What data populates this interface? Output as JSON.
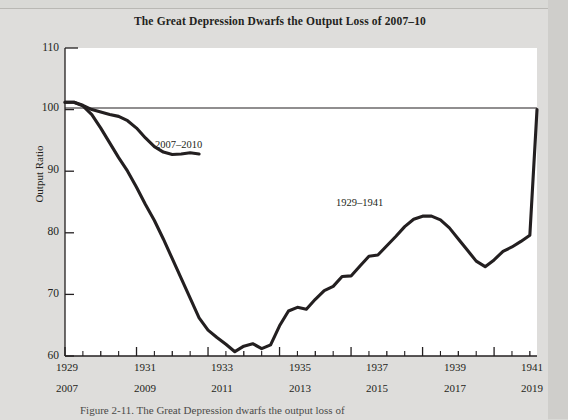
{
  "figure": {
    "title": "The Great Depression Dwarfs the Output Loss of 2007–10",
    "caption": "Figure 2-11. The Great Depression dwarfs the output loss of"
  },
  "chart_data": {
    "type": "line",
    "title": "The Great Depression Dwarfs the Output Loss of 2007–10",
    "xlabel": "",
    "ylabel": "Output Ratio",
    "ylim": [
      60,
      110
    ],
    "yticks": [
      60,
      70,
      80,
      90,
      100,
      110
    ],
    "xlim": [
      1929,
      1942.2
    ],
    "xticks_top": [
      1929,
      1931,
      1933,
      1935,
      1937,
      1939,
      1941
    ],
    "xticks_bottom": [
      2007,
      2009,
      2011,
      2013,
      2015,
      2017,
      2019
    ],
    "minor_tick_interval": 1,
    "grid": false,
    "legend": "inline-annotations",
    "reference_line": {
      "y": 100,
      "label": ""
    },
    "series": [
      {
        "name": "1929–1941",
        "color": "#231f20",
        "x": [
          1929.0,
          1929.25,
          1929.5,
          1929.75,
          1930.0,
          1930.25,
          1930.5,
          1930.75,
          1931.0,
          1931.25,
          1931.5,
          1931.75,
          1932.0,
          1932.25,
          1932.5,
          1932.75,
          1933.0,
          1933.25,
          1933.5,
          1933.75,
          1934.0,
          1934.25,
          1934.5,
          1934.75,
          1935.0,
          1935.25,
          1935.5,
          1935.75,
          1936.0,
          1936.25,
          1936.5,
          1936.75,
          1937.0,
          1937.25,
          1937.5,
          1937.75,
          1938.0,
          1938.25,
          1938.5,
          1938.75,
          1939.0,
          1939.25,
          1939.5,
          1939.75,
          1940.0,
          1940.25,
          1940.5,
          1940.75,
          1941.0,
          1941.25,
          1941.5,
          1941.75,
          1942.0,
          1942.2
        ],
        "y": [
          101.2,
          101.2,
          100.6,
          99.2,
          97.0,
          94.6,
          92.2,
          90.0,
          87.4,
          84.6,
          82.0,
          79.0,
          75.8,
          72.6,
          69.4,
          66.2,
          64.2,
          63.0,
          61.9,
          60.7,
          61.6,
          62.0,
          61.2,
          61.8,
          64.9,
          67.3,
          67.9,
          67.6,
          69.2,
          70.6,
          71.3,
          72.9,
          73.0,
          74.6,
          76.2,
          76.4,
          77.9,
          79.4,
          81.0,
          82.2,
          82.7,
          82.7,
          82.1,
          80.8,
          79.0,
          77.2,
          75.4,
          74.5,
          75.6,
          77.0,
          77.7,
          78.6,
          79.6,
          100.0
        ],
        "note": "Output ratio (actual/potential), percent of normal output, 1929 Q1 through 1942"
      },
      {
        "name": "2007–2010",
        "color": "#231f20",
        "x": [
          1929.0,
          1929.25,
          1929.5,
          1929.75,
          1930.0,
          1930.25,
          1930.5,
          1930.75,
          1931.0,
          1931.25,
          1931.5,
          1931.75,
          1932.0,
          1932.25,
          1932.5,
          1932.75
        ],
        "y": [
          101.2,
          101.2,
          100.7,
          100.0,
          99.6,
          99.2,
          98.9,
          98.2,
          97.0,
          95.4,
          94.0,
          93.1,
          92.7,
          92.8,
          93.0,
          92.8
        ],
        "note": "Mapped to bottom axis years 2007 Q1 through 2010 Q4"
      }
    ],
    "annotations": [
      {
        "text": "2007–2010",
        "x": 1931.3,
        "y": 95.5
      },
      {
        "text": "1929–1941",
        "x": 1936.1,
        "y": 86.0
      }
    ]
  },
  "axes": {
    "y_label": "Output Ratio",
    "y_tick_labels": [
      "110",
      "100",
      "90",
      "80",
      "70",
      "60"
    ],
    "x_tick_labels_top": [
      "1929",
      "1931",
      "1933",
      "1935",
      "1937",
      "1939",
      "1941"
    ],
    "x_tick_labels_bottom": [
      "2007",
      "2009",
      "2011",
      "2013",
      "2015",
      "2017",
      "2019"
    ]
  }
}
